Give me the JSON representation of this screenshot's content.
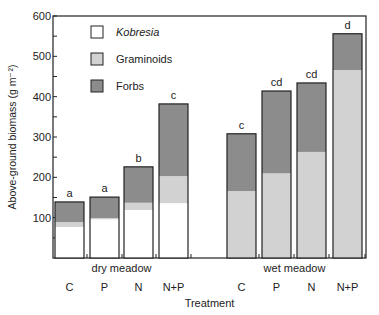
{
  "chart_data": {
    "type": "bar",
    "stacked": true,
    "title": "",
    "xlabel": "Treatment",
    "ylabel": "Above-ground biomass (g m⁻²)",
    "ylim": [
      0,
      600
    ],
    "yticks": [
      100,
      200,
      300,
      400,
      500,
      600
    ],
    "groups": [
      {
        "label": "dry meadow",
        "categories": [
          "C",
          "P",
          "N",
          "N+P"
        ]
      },
      {
        "label": "wet meadow",
        "categories": [
          "C",
          "P",
          "N",
          "N+P"
        ]
      }
    ],
    "series": [
      {
        "name": "Kobresia",
        "italic": true,
        "color": "#ffffff",
        "values": [
          77,
          96,
          119,
          136,
          0,
          0,
          0,
          0
        ]
      },
      {
        "name": "Graminoids",
        "italic": false,
        "color": "#d2d2d2",
        "values": [
          12,
          3,
          18,
          67,
          166,
          210,
          263,
          466
        ]
      },
      {
        "name": "Forbs",
        "italic": false,
        "color": "#8c8c8c",
        "values": [
          50,
          52,
          89,
          179,
          142,
          204,
          171,
          90
        ]
      }
    ],
    "totals": [
      139,
      151,
      226,
      382,
      308,
      414,
      434,
      556
    ],
    "significance_letters": [
      "a",
      "a",
      "b",
      "c",
      "c",
      "cd",
      "cd",
      "d"
    ],
    "legend": {
      "position": "top-left"
    },
    "grid": false
  }
}
